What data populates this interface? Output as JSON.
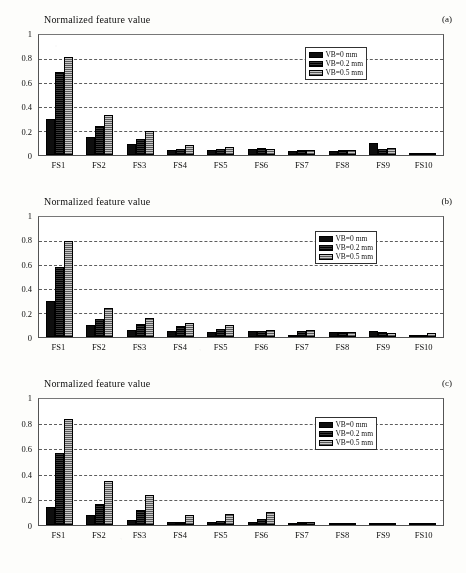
{
  "figure": {
    "axis_title": "Normalized feature value",
    "yticks": [
      "0",
      "0.2",
      "0.4",
      "0.6",
      "0.8",
      "1"
    ],
    "ytick_values": [
      0,
      0.2,
      0.4,
      0.6,
      0.8,
      1
    ],
    "categories": [
      "FS1",
      "FS2",
      "FS3",
      "FS4",
      "FS5",
      "FS6",
      "FS7",
      "FS8",
      "FS9",
      "FS10"
    ],
    "legend": [
      {
        "label": "VB=0 mm",
        "style": "solid-black"
      },
      {
        "label": "VB=0.2 mm",
        "style": "dark-hatch"
      },
      {
        "label": "VB=0.5 mm",
        "style": "light-crosshatch"
      }
    ],
    "panels": [
      {
        "tag": "(a)"
      },
      {
        "tag": "(b)"
      },
      {
        "tag": "(c)"
      }
    ]
  },
  "chart_data": [
    {
      "type": "bar",
      "title": "Normalized feature value",
      "panel": "(a)",
      "xlabel": "",
      "ylabel": "Normalized feature value",
      "ylim": [
        0,
        1
      ],
      "yticks": [
        0,
        0.2,
        0.4,
        0.6,
        0.8,
        1
      ],
      "grid": true,
      "legend_position": "top-right-inside",
      "categories": [
        "FS1",
        "FS2",
        "FS3",
        "FS4",
        "FS5",
        "FS6",
        "FS7",
        "FS8",
        "FS9",
        "FS10"
      ],
      "series": [
        {
          "name": "VB=0 mm",
          "values": [
            0.3,
            0.15,
            0.09,
            0.04,
            0.04,
            0.05,
            0.03,
            0.03,
            0.1,
            0.02
          ]
        },
        {
          "name": "VB=0.2 mm",
          "values": [
            0.69,
            0.24,
            0.13,
            0.05,
            0.05,
            0.06,
            0.04,
            0.04,
            0.05,
            0.02
          ]
        },
        {
          "name": "VB=0.5 mm",
          "values": [
            0.82,
            0.33,
            0.2,
            0.08,
            0.07,
            0.05,
            0.04,
            0.04,
            0.06,
            0.02
          ]
        }
      ]
    },
    {
      "type": "bar",
      "title": "Normalized feature value",
      "panel": "(b)",
      "xlabel": "",
      "ylabel": "Normalized feature value",
      "ylim": [
        0,
        1
      ],
      "yticks": [
        0,
        0.2,
        0.4,
        0.6,
        0.8,
        1
      ],
      "grid": true,
      "legend_position": "top-right-inside",
      "categories": [
        "FS1",
        "FS2",
        "FS3",
        "FS4",
        "FS5",
        "FS6",
        "FS7",
        "FS8",
        "FS9",
        "FS10"
      ],
      "series": [
        {
          "name": "VB=0 mm",
          "values": [
            0.3,
            0.1,
            0.06,
            0.05,
            0.04,
            0.05,
            0.02,
            0.04,
            0.05,
            0.01
          ]
        },
        {
          "name": "VB=0.2 mm",
          "values": [
            0.58,
            0.15,
            0.11,
            0.09,
            0.07,
            0.05,
            0.05,
            0.04,
            0.04,
            0.02
          ]
        },
        {
          "name": "VB=0.5 mm",
          "values": [
            0.8,
            0.24,
            0.16,
            0.12,
            0.1,
            0.06,
            0.06,
            0.04,
            0.03,
            0.03
          ]
        }
      ]
    },
    {
      "type": "bar",
      "title": "Normalized feature value",
      "panel": "(c)",
      "xlabel": "",
      "ylabel": "Normalized feature value",
      "ylim": [
        0,
        1
      ],
      "yticks": [
        0,
        0.2,
        0.4,
        0.6,
        0.8,
        1
      ],
      "grid": true,
      "legend_position": "top-right-inside",
      "categories": [
        "FS1",
        "FS2",
        "FS3",
        "FS4",
        "FS5",
        "FS6",
        "FS7",
        "FS8",
        "FS9",
        "FS10"
      ],
      "series": [
        {
          "name": "VB=0 mm",
          "values": [
            0.14,
            0.08,
            0.04,
            0.02,
            0.02,
            0.02,
            0.01,
            0.01,
            0.004,
            0.002
          ]
        },
        {
          "name": "VB=0.2 mm",
          "values": [
            0.57,
            0.17,
            0.12,
            0.02,
            0.03,
            0.05,
            0.02,
            0.01,
            0.005,
            0.002
          ]
        },
        {
          "name": "VB=0.5 mm",
          "values": [
            0.84,
            0.35,
            0.24,
            0.08,
            0.09,
            0.1,
            0.02,
            0.01,
            0.005,
            0.002
          ]
        }
      ]
    }
  ]
}
